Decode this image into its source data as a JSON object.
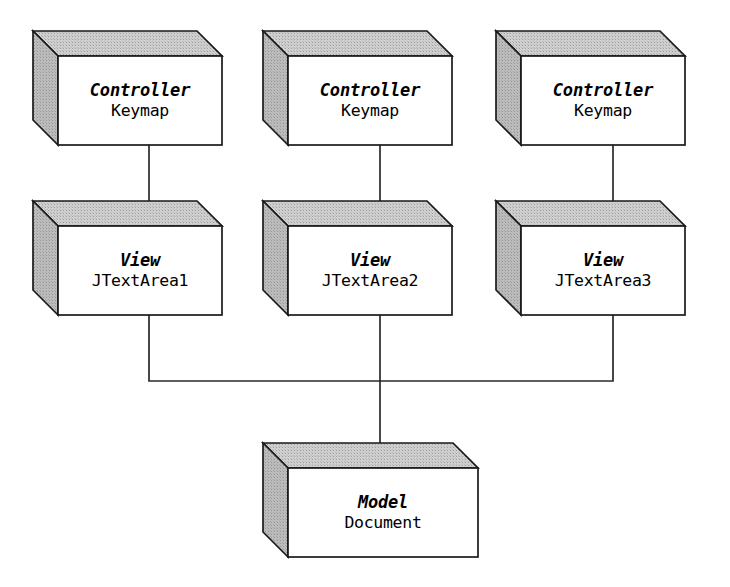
{
  "diagram": {
    "background_color": "#ffffff",
    "stroke_color": "#1a1a1a",
    "face_color": "#ffffff",
    "top_face_color": "#c9c9c9",
    "side_face_color": "#b4b4b4",
    "nodes": [
      {
        "id": "controller1",
        "role": "Controller",
        "class_name": "Keymap",
        "x": 58,
        "y": 56,
        "width": 164,
        "height": 89,
        "depth": 25
      },
      {
        "id": "controller2",
        "role": "Controller",
        "class_name": "Keymap",
        "x": 288,
        "y": 56,
        "width": 164,
        "height": 89,
        "depth": 25
      },
      {
        "id": "controller3",
        "role": "Controller",
        "class_name": "Keymap",
        "x": 521,
        "y": 56,
        "width": 164,
        "height": 89,
        "depth": 25
      },
      {
        "id": "view1",
        "role": "View",
        "class_name": "JTextArea1",
        "x": 58,
        "y": 226,
        "width": 164,
        "height": 89,
        "depth": 25
      },
      {
        "id": "view2",
        "role": "View",
        "class_name": "JTextArea2",
        "x": 288,
        "y": 226,
        "width": 164,
        "height": 89,
        "depth": 25
      },
      {
        "id": "view3",
        "role": "View",
        "class_name": "JTextArea3",
        "x": 521,
        "y": 226,
        "width": 164,
        "height": 89,
        "depth": 25
      },
      {
        "id": "model",
        "role": "Model",
        "class_name": "Document",
        "x": 288,
        "y": 468,
        "width": 190,
        "height": 89,
        "depth": 25
      }
    ],
    "connectors": [
      {
        "id": "controller1-to-view1",
        "from": "controller1",
        "to": "view1",
        "points": "149,145 149,213"
      },
      {
        "id": "controller2-to-view2",
        "from": "controller2",
        "to": "view2",
        "points": "380,145 380,213"
      },
      {
        "id": "controller3-to-view3",
        "from": "controller3",
        "to": "view3",
        "points": "613,145 613,213"
      },
      {
        "id": "view1-to-model",
        "from": "view1",
        "to": "model",
        "points": "149,315 149,381 380,381"
      },
      {
        "id": "view3-to-model",
        "from": "view3",
        "to": "model",
        "points": "613,315 613,381 380,381"
      },
      {
        "id": "view2-to-model",
        "from": "view2",
        "to": "model",
        "points": "380,315 380,455"
      }
    ]
  }
}
